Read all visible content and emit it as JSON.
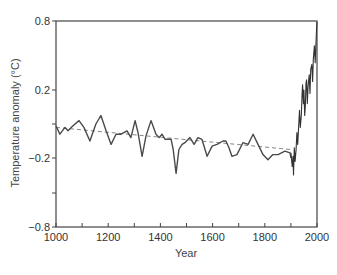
{
  "chart_data": {
    "type": "line",
    "title": "",
    "xlabel": "Year",
    "ylabel": "Temperature anomaly (°C)",
    "xlim": [
      1000,
      2000
    ],
    "x_ticks": [
      1000,
      1100,
      1200,
      1300,
      1400,
      1500,
      1600,
      1700,
      1800,
      1900,
      2000
    ],
    "x_tick_labels": [
      "1000",
      "",
      "1200",
      "",
      "1400",
      "",
      "1600",
      "",
      "1800",
      "",
      "2000"
    ],
    "y_tick_labels": [
      "0.8",
      "0.2",
      "",
      "−0.2",
      "",
      "−0.8"
    ],
    "grid": false,
    "legend": null,
    "series": [
      {
        "name": "Reconstruction (smoothed)",
        "style": "solid",
        "color": "#444444",
        "x": [
          1000,
          1015,
          1034,
          1046,
          1065,
          1088,
          1107,
          1130,
          1153,
          1172,
          1192,
          1211,
          1230,
          1249,
          1272,
          1287,
          1303,
          1314,
          1330,
          1345,
          1364,
          1383,
          1395,
          1406,
          1418,
          1441,
          1449,
          1460,
          1471,
          1483,
          1494,
          1513,
          1529,
          1544,
          1559,
          1579,
          1598,
          1617,
          1640,
          1651,
          1663,
          1674,
          1693,
          1716,
          1736,
          1755,
          1774,
          1793,
          1812,
          1831,
          1851,
          1877,
          1897,
          1900
        ],
        "values": [
          -0.01,
          -0.06,
          -0.02,
          -0.04,
          -0.01,
          0.02,
          -0.02,
          -0.1,
          0.0,
          0.05,
          -0.04,
          -0.12,
          -0.06,
          -0.06,
          -0.04,
          -0.08,
          0.02,
          -0.05,
          -0.19,
          -0.07,
          0.02,
          -0.06,
          -0.08,
          -0.06,
          -0.09,
          -0.09,
          -0.15,
          -0.29,
          -0.15,
          -0.12,
          -0.11,
          -0.08,
          -0.12,
          -0.08,
          -0.09,
          -0.19,
          -0.13,
          -0.12,
          -0.1,
          -0.1,
          -0.14,
          -0.19,
          -0.18,
          -0.11,
          -0.12,
          -0.06,
          -0.12,
          -0.18,
          -0.21,
          -0.18,
          -0.18,
          -0.16,
          -0.17,
          -0.2
        ]
      },
      {
        "name": "Instrumental record",
        "style": "solid",
        "color": "#333333",
        "x": [
          1900,
          1903,
          1905,
          1908,
          1910,
          1913,
          1916,
          1920,
          1923,
          1926,
          1930,
          1933,
          1936,
          1940,
          1943,
          1945,
          1948,
          1950,
          1953,
          1955,
          1958,
          1960,
          1963,
          1966,
          1970,
          1973,
          1976,
          1980,
          1983,
          1986,
          1990,
          1993,
          1996,
          1998,
          2000
        ],
        "values": [
          -0.17,
          -0.22,
          -0.25,
          -0.19,
          -0.3,
          -0.14,
          -0.22,
          -0.15,
          -0.05,
          -0.12,
          -0.01,
          0.08,
          -0.02,
          0.05,
          0.18,
          0.23,
          0.12,
          0.2,
          0.05,
          0.1,
          0.24,
          0.26,
          0.12,
          0.22,
          0.29,
          0.18,
          0.32,
          0.35,
          0.25,
          0.38,
          0.46,
          0.36,
          0.48,
          0.55,
          0.6
        ]
      },
      {
        "name": "Linear trend",
        "style": "dashed",
        "color": "#666666",
        "x": [
          1000,
          1900
        ],
        "values": [
          -0.02,
          -0.15
        ]
      }
    ],
    "colors": {
      "frame": "#333333",
      "line": "#444444",
      "trend": "#777777",
      "background": "#ffffff"
    }
  }
}
